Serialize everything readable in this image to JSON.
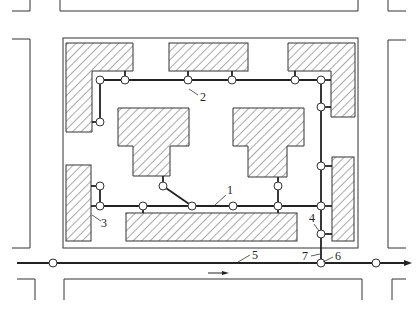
{
  "diagram": {
    "type": "site-pipe-network-plan",
    "colors": {
      "line": "#333333",
      "pipe": "#222222",
      "hatch": "#555555",
      "background": "#ffffff",
      "node_fill": "#ffffff"
    },
    "labels": [
      {
        "id": "1",
        "text": "1",
        "x": 226,
        "y": 191
      },
      {
        "id": "2",
        "text": "2",
        "x": 200,
        "y": 99
      },
      {
        "id": "3",
        "text": "3",
        "x": 102,
        "y": 225
      },
      {
        "id": "4",
        "text": "4",
        "x": 310,
        "y": 221
      },
      {
        "id": "5",
        "text": "5",
        "x": 255,
        "y": 259
      },
      {
        "id": "6",
        "text": "6",
        "x": 335,
        "y": 259
      },
      {
        "id": "7",
        "text": "7",
        "x": 303,
        "y": 259
      }
    ],
    "flow_direction": "right"
  }
}
